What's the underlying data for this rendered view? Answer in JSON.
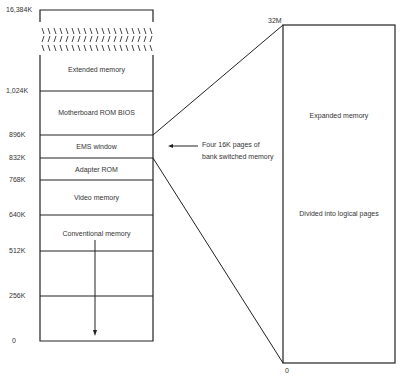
{
  "diagram": {
    "type": "memory-map",
    "left_axis_labels": [
      "16,384K",
      "1,024K",
      "896K",
      "832K",
      "768K",
      "640K",
      "512K",
      "256K",
      "0"
    ],
    "regions": [
      {
        "label": "Extended memory",
        "from": "1,024K",
        "to": "16,384K"
      },
      {
        "label": "Motherboard ROM BIOS",
        "from": "896K",
        "to": "1,024K"
      },
      {
        "label": "EMS window",
        "from": "832K",
        "to": "896K"
      },
      {
        "label": "Adapter ROM",
        "from": "768K",
        "to": "832K"
      },
      {
        "label": "Video memory",
        "from": "640K",
        "to": "768K"
      },
      {
        "label": "Conventional memory",
        "from": "0",
        "to": "640K"
      }
    ],
    "annotation": {
      "line1": "Four 16K pages of",
      "line2": "bank switched memory"
    },
    "expanded": {
      "top_label": "32M",
      "bottom_label": "0",
      "title": "Expanded memory",
      "subtitle": "Divided into logical pages"
    },
    "colors": {
      "line": "#222222",
      "background": "#ffffff",
      "text": "#333333"
    }
  }
}
